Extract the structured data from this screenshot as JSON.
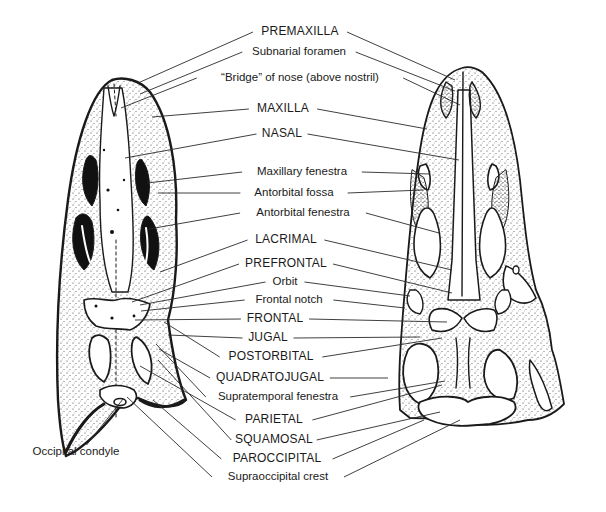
{
  "figure": {
    "ink_color": "#1a1a1a",
    "background_color": "#ffffff"
  },
  "labels": [
    {
      "id": "premaxilla",
      "text": "PREMAXILLA",
      "x": 300,
      "y": 32,
      "caps": true
    },
    {
      "id": "subnarial-foramen",
      "text": "Subnarial foramen",
      "x": 299,
      "y": 52,
      "caps": false
    },
    {
      "id": "bridge-of-nose",
      "text": "“Bridge” of nose (above nostril)",
      "x": 300,
      "y": 78,
      "caps": false
    },
    {
      "id": "maxilla",
      "text": "MAXILLA",
      "x": 283,
      "y": 109,
      "caps": true
    },
    {
      "id": "nasal",
      "text": "NASAL",
      "x": 282,
      "y": 134,
      "caps": true
    },
    {
      "id": "maxillary-fenestra",
      "text": "Maxillary fenestra",
      "x": 302,
      "y": 172,
      "caps": false
    },
    {
      "id": "antorbital-fossa",
      "text": "Antorbital fossa",
      "x": 294,
      "y": 193,
      "caps": false
    },
    {
      "id": "antorbital-fenestra",
      "text": "Antorbital fenestra",
      "x": 303,
      "y": 213,
      "caps": false
    },
    {
      "id": "lacrimal",
      "text": "LACRIMAL",
      "x": 286,
      "y": 240,
      "caps": true
    },
    {
      "id": "prefrontal",
      "text": "PREFRONTAL",
      "x": 286,
      "y": 264,
      "caps": true
    },
    {
      "id": "orbit",
      "text": "Orbit",
      "x": 285,
      "y": 282,
      "caps": false
    },
    {
      "id": "frontal-notch",
      "text": "Frontal notch",
      "x": 289,
      "y": 300,
      "caps": false
    },
    {
      "id": "frontal",
      "text": "FRONTAL",
      "x": 275,
      "y": 319,
      "caps": true
    },
    {
      "id": "jugal",
      "text": "JUGAL",
      "x": 268,
      "y": 338,
      "caps": true
    },
    {
      "id": "postorbital",
      "text": "POSTORBITAL",
      "x": 271,
      "y": 357,
      "caps": true
    },
    {
      "id": "quadratojugal",
      "text": "QUADRATOJUGAL",
      "x": 270,
      "y": 378,
      "caps": true
    },
    {
      "id": "supratemporal-fenestra",
      "text": "Supratemporal fenestra",
      "x": 278,
      "y": 397,
      "caps": false
    },
    {
      "id": "parietal",
      "text": "PARIETAL",
      "x": 274,
      "y": 420,
      "caps": true
    },
    {
      "id": "squamosal",
      "text": "SQUAMOSAL",
      "x": 274,
      "y": 440,
      "caps": true
    },
    {
      "id": "paroccipital",
      "text": "PAROCCIPITAL",
      "x": 277,
      "y": 459,
      "caps": true
    },
    {
      "id": "supraoccipital-crest",
      "text": "Supraoccipital crest",
      "x": 278,
      "y": 477,
      "caps": false
    },
    {
      "id": "occipital-condyle",
      "text": "Occipital condyle",
      "x": 76,
      "y": 452,
      "caps": false
    }
  ],
  "leaders": [
    {
      "label": "premaxilla",
      "from": [
        258,
        37
      ],
      "left": [
        138,
        83
      ],
      "right": [
        455,
        80
      ]
    },
    {
      "label": "subnarial-foramen",
      "from": [
        248,
        57
      ],
      "left": [
        140,
        94
      ],
      "right": [
        455,
        91
      ]
    },
    {
      "label": "bridge-of-nose",
      "from": [
        228,
        83
      ],
      "left": [
        121,
        108
      ],
      "right": [
        460,
        105
      ]
    },
    {
      "label": "maxilla",
      "from": [
        253,
        114
      ],
      "left": [
        152,
        117
      ],
      "right": [
        427,
        129
      ]
    },
    {
      "label": "nasal",
      "from": [
        260,
        139
      ],
      "left": [
        125,
        158
      ],
      "right": [
        459,
        160
      ]
    },
    {
      "label": "maxillary-fenestra",
      "from": [
        255,
        177
      ],
      "left": [
        147,
        183
      ],
      "right": [
        430,
        174
      ]
    },
    {
      "label": "antorbital-fossa",
      "from": [
        252,
        198
      ],
      "left": [
        158,
        193
      ],
      "right": [
        423,
        190
      ]
    },
    {
      "label": "antorbital-fenestra",
      "from": [
        250,
        218
      ],
      "left": [
        149,
        229
      ],
      "right": [
        439,
        233
      ]
    },
    {
      "label": "lacrimal",
      "from": [
        246,
        245
      ],
      "left": [
        160,
        272
      ],
      "right": [
        452,
        270
      ]
    },
    {
      "label": "prefrontal",
      "from": [
        245,
        269
      ],
      "left": [
        132,
        302
      ],
      "right": [
        452,
        293
      ]
    },
    {
      "label": "orbit",
      "from": [
        270,
        287
      ],
      "left": [
        140,
        305
      ],
      "right": [
        410,
        296
      ]
    },
    {
      "label": "frontal-notch",
      "from": [
        256,
        305
      ],
      "left": [
        141,
        311
      ],
      "right": [
        405,
        308
      ]
    },
    {
      "label": "frontal",
      "from": [
        247,
        324
      ],
      "left": [
        135,
        320
      ],
      "right": [
        447,
        322
      ]
    },
    {
      "label": "jugal",
      "from": [
        249,
        343
      ],
      "left": [
        168,
        335
      ],
      "right": [
        420,
        337
      ]
    },
    {
      "label": "postorbital",
      "from": [
        233,
        362
      ],
      "left": [
        164,
        322
      ],
      "right": [
        442,
        338
      ]
    },
    {
      "label": "quadratojugal",
      "from": [
        226,
        383
      ],
      "left": [
        159,
        349
      ],
      "right": [
        388,
        378
      ]
    },
    {
      "label": "supratemporal-fenestra",
      "from": [
        220,
        402
      ],
      "left": [
        156,
        344
      ],
      "right": [
        445,
        381
      ]
    },
    {
      "label": "parietal",
      "from": [
        239,
        425
      ],
      "left": [
        140,
        366
      ],
      "right": [
        442,
        385
      ]
    },
    {
      "label": "squamosal",
      "from": [
        236,
        445
      ],
      "left": [
        158,
        360
      ],
      "right": [
        440,
        412
      ]
    },
    {
      "label": "paroccipital",
      "from": [
        233,
        464
      ],
      "left": [
        153,
        400
      ],
      "right": [
        424,
        420
      ]
    },
    {
      "label": "supraoccipital-crest",
      "from": [
        222,
        482
      ],
      "left": [
        127,
        397
      ],
      "right": [
        460,
        420
      ]
    },
    {
      "label": "occipital-condyle",
      "from": [
        100,
        446
      ],
      "left": null,
      "right": [
        123,
        399
      ]
    }
  ]
}
